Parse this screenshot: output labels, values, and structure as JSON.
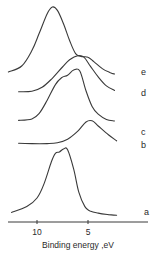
{
  "chart_data": {
    "type": "line",
    "title": "",
    "xlabel": "Binding energy ,eV",
    "ylabel": "",
    "x_reversed": true,
    "xlim": [
      13,
      1
    ],
    "x_ticks": [
      10,
      5
    ],
    "x_tick_labels": [
      "10",
      "5"
    ],
    "grid": false,
    "legend": "curve labels at right end",
    "series": [
      {
        "name": "a",
        "x": [
          12.5,
          11.0,
          10.0,
          9.3,
          8.6,
          8.2,
          7.8,
          7.4,
          7.0,
          6.4,
          5.9,
          5.3,
          4.8,
          4.0,
          3.0,
          2.2
        ],
        "y": [
          0.05,
          0.13,
          0.25,
          0.45,
          0.75,
          0.87,
          0.89,
          0.93,
          0.92,
          0.65,
          0.33,
          0.13,
          0.07,
          0.04,
          0.02,
          0.01
        ]
      },
      {
        "name": "b",
        "x": [
          11.8,
          10.5,
          9.0,
          8.0,
          7.0,
          6.0,
          5.2,
          4.6,
          4.0,
          3.0,
          2.2
        ],
        "y": [
          0.02,
          0.01,
          0.01,
          0.03,
          0.12,
          0.32,
          0.55,
          0.58,
          0.45,
          0.23,
          0.08
        ]
      },
      {
        "name": "c",
        "x": [
          11.8,
          10.5,
          9.8,
          9.0,
          8.2,
          7.6,
          7.0,
          6.4,
          5.8,
          5.2,
          4.6,
          4.0,
          3.2,
          2.4
        ],
        "y": [
          0.03,
          0.06,
          0.16,
          0.42,
          0.72,
          0.85,
          0.9,
          1.0,
          0.98,
          0.6,
          0.3,
          0.15,
          0.05,
          0.02
        ]
      },
      {
        "name": "d",
        "x": [
          11.8,
          10.5,
          9.5,
          8.5,
          7.5,
          6.8,
          6.0,
          5.4,
          4.8,
          4.0,
          3.2,
          2.4
        ],
        "y": [
          0.05,
          0.06,
          0.15,
          0.35,
          0.6,
          0.76,
          0.85,
          0.82,
          0.63,
          0.38,
          0.18,
          0.08
        ]
      },
      {
        "name": "e",
        "x": [
          12.8,
          11.5,
          10.5,
          9.8,
          9.0,
          8.5,
          8.0,
          7.4,
          6.8,
          6.2,
          5.6,
          5.0,
          4.4,
          3.6,
          2.8,
          2.4
        ],
        "y": [
          0.03,
          0.12,
          0.35,
          0.6,
          0.9,
          1.0,
          0.95,
          0.75,
          0.5,
          0.3,
          0.26,
          0.25,
          0.18,
          0.08,
          0.02,
          0.0
        ]
      }
    ]
  }
}
